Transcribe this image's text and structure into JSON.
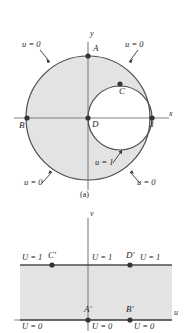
{
  "figure": {
    "caption_a": "(a)",
    "panel_a": {
      "axis_x": "x",
      "axis_y": "y",
      "tick_one": "1",
      "points": [
        {
          "name": "A",
          "label": "A",
          "x": 88,
          "y": 56
        },
        {
          "name": "B",
          "label": "B",
          "x": 27,
          "y": 118
        },
        {
          "name": "C",
          "label": "C",
          "x": 120,
          "y": 84
        },
        {
          "name": "D",
          "label": "D",
          "x": 88,
          "y": 118
        },
        {
          "name": "one",
          "label": "1",
          "x": 152,
          "y": 118
        }
      ],
      "boundary_labels": [
        {
          "name": "u0-top-left",
          "text": "u = 0"
        },
        {
          "name": "u0-top-right",
          "text": "u = 0"
        },
        {
          "name": "u1-inner",
          "text": "u = 1"
        },
        {
          "name": "u0-bottom-left",
          "text": "u = 0"
        },
        {
          "name": "u0-bottom-right",
          "text": "u = 0"
        }
      ],
      "big_circle": {
        "cx": 88,
        "cy": 118,
        "r": 62
      },
      "small_circle": {
        "cx": 120,
        "cy": 118,
        "r": 32
      }
    },
    "panel_b": {
      "axis_u": "u",
      "axis_v": "v",
      "points": [
        {
          "name": "A-prime",
          "label": "A′",
          "x": 88,
          "y": 320
        },
        {
          "name": "B-prime",
          "label": "B′",
          "x": 130,
          "y": 320
        },
        {
          "name": "C-prime",
          "label": "C′",
          "x": 52,
          "y": 265
        },
        {
          "name": "D-prime",
          "label": "D′",
          "x": 130,
          "y": 265
        }
      ],
      "boundary_labels": [
        {
          "name": "U1-left",
          "text": "U = 1"
        },
        {
          "name": "U1-center",
          "text": "U = 1"
        },
        {
          "name": "U1-right",
          "text": "U = 1"
        },
        {
          "name": "U0-left",
          "text": "U = 0"
        },
        {
          "name": "U0-center",
          "text": "U = 0"
        },
        {
          "name": "U0-right",
          "text": "U = 0"
        }
      ],
      "strip": {
        "left": 20,
        "right": 172,
        "top": 265,
        "bottom": 320
      }
    },
    "colors": {
      "fill": "#e3e3e3",
      "stroke": "#4d4d4d",
      "axis": "#808080",
      "dot": "#333333"
    }
  }
}
